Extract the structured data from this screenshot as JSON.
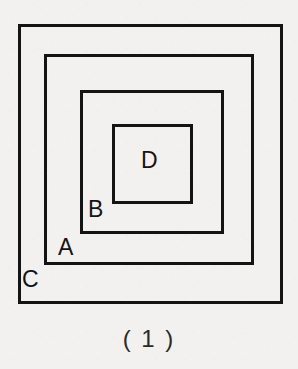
{
  "figure": {
    "caption": "( 1 )",
    "background_color": "#f2f1ef",
    "line_color": "#141414",
    "squares": [
      {
        "id": "C",
        "label": "C",
        "role": "outermost-square",
        "x": 18,
        "y": 24,
        "width": 265,
        "height": 280,
        "stroke_width": 3,
        "label_x": 22,
        "label_y": 268
      },
      {
        "id": "A",
        "label": "A",
        "role": "second-square",
        "x": 44,
        "y": 54,
        "width": 210,
        "height": 211,
        "stroke_width": 3,
        "label_x": 58,
        "label_y": 236
      },
      {
        "id": "B",
        "label": "B",
        "role": "third-square",
        "x": 80,
        "y": 90,
        "width": 144,
        "height": 144,
        "stroke_width": 3,
        "label_x": 88,
        "label_y": 198
      },
      {
        "id": "D",
        "label": "D",
        "role": "innermost-square",
        "x": 112,
        "y": 124,
        "width": 81,
        "height": 80,
        "stroke_width": 3,
        "label_x": 141,
        "label_y": 149
      }
    ],
    "caption_x": 0,
    "caption_y": 326
  }
}
